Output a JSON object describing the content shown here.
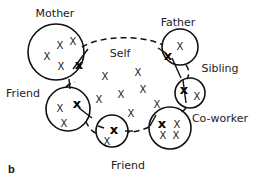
{
  "figure_label": "b",
  "center": {
    "label": "Self",
    "x": 120,
    "y": 57,
    "members": [
      {
        "x": 105,
        "y": 76
      },
      {
        "x": 138,
        "y": 72
      },
      {
        "x": 99,
        "y": 99
      },
      {
        "x": 121,
        "y": 94
      },
      {
        "x": 143,
        "y": 89
      },
      {
        "x": 157,
        "y": 104
      },
      {
        "x": 131,
        "y": 113
      }
    ]
  },
  "nodes": [
    {
      "id": "mother",
      "label": "Mother",
      "label_x": 55,
      "label_y": 17,
      "cx": 56,
      "cy": 52,
      "r": 28,
      "self_mark": {
        "x": 79,
        "y": 65
      },
      "members": [
        {
          "x": 60,
          "y": 45
        },
        {
          "x": 73,
          "y": 41
        },
        {
          "x": 47,
          "y": 56
        },
        {
          "x": 61,
          "y": 66
        }
      ]
    },
    {
      "id": "father",
      "label": "Father",
      "label_x": 178,
      "label_y": 26,
      "cx": 180,
      "cy": 47,
      "r": 18,
      "self_mark": {
        "x": 168,
        "y": 56
      },
      "members": [
        {
          "x": 180,
          "y": 46
        }
      ]
    },
    {
      "id": "sibling",
      "label": "Sibling",
      "label_x": 220,
      "label_y": 72,
      "cx": 190,
      "cy": 93,
      "r": 15,
      "self_mark": {
        "x": 184,
        "y": 90
      },
      "members": [
        {
          "x": 197,
          "y": 96
        }
      ]
    },
    {
      "id": "coworker",
      "label": "Co-worker",
      "label_x": 220,
      "label_y": 122,
      "cx": 170,
      "cy": 128,
      "r": 21,
      "self_mark": {
        "x": 162,
        "y": 124
      },
      "members": [
        {
          "x": 177,
          "y": 124
        },
        {
          "x": 163,
          "y": 135
        },
        {
          "x": 176,
          "y": 135
        }
      ]
    },
    {
      "id": "friend-left",
      "label": "Friend",
      "label_x": 23,
      "label_y": 97,
      "cx": 68,
      "cy": 109,
      "r": 22,
      "self_mark": {
        "x": 77,
        "y": 104
      },
      "members": [
        {
          "x": 60,
          "y": 108
        },
        {
          "x": 64,
          "y": 123
        }
      ]
    },
    {
      "id": "friend-bottom",
      "label": "Friend",
      "label_x": 128,
      "label_y": 169,
      "cx": 112,
      "cy": 131,
      "r": 16,
      "self_mark": {
        "x": 114,
        "y": 130
      },
      "members": [
        {
          "x": 107,
          "y": 141
        }
      ]
    }
  ]
}
